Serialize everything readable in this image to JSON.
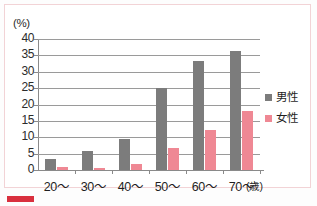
{
  "chart_data": {
    "type": "bar",
    "title": "",
    "subtitle": "",
    "unit_label": "(%)",
    "xlabel": "(歳)",
    "ylabel": "",
    "categories": [
      "20～",
      "30～",
      "40～",
      "50～",
      "60～",
      "70～"
    ],
    "series": [
      {
        "name": "男性",
        "color": "#7c7c7c",
        "values": [
          3.4,
          5.7,
          9.5,
          24.9,
          33.4,
          36.2
        ]
      },
      {
        "name": "女性",
        "color": "#ef8894",
        "values": [
          0.8,
          0.7,
          1.9,
          6.8,
          12.2,
          18.0
        ]
      }
    ],
    "ylim": [
      0,
      40
    ],
    "yticks": [
      "0",
      "5",
      "10",
      "15",
      "20",
      "25",
      "30",
      "35",
      "40"
    ],
    "ytick_values": [
      0,
      5,
      10,
      15,
      20,
      25,
      30,
      35,
      40
    ],
    "grid": true,
    "legend_position": "right"
  },
  "colors": {
    "male": "#7c7c7c",
    "female": "#ef8894",
    "frame": "#f2d3d6",
    "marker": "#d9303e",
    "axis": "#8a8a8a",
    "grid": "#9a9a9a"
  }
}
